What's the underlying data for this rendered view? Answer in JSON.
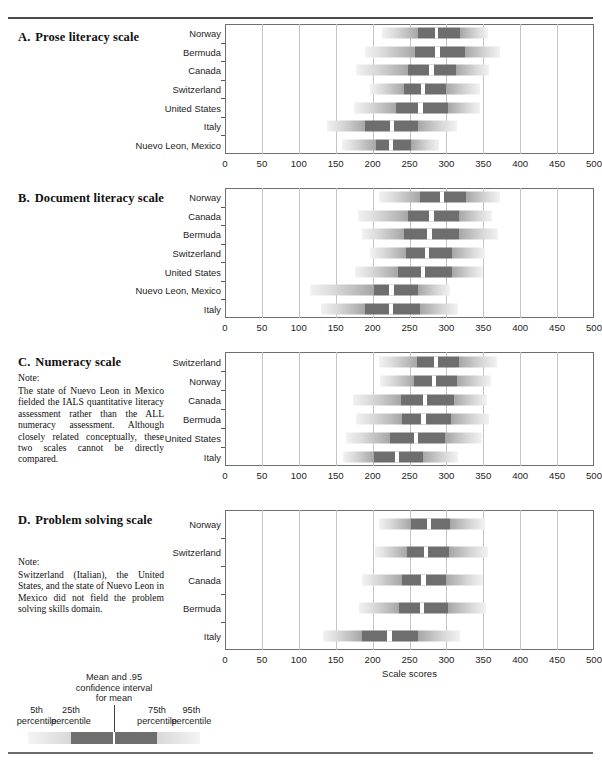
{
  "figure": {
    "axis_title": "Scale scores",
    "x_min": 0,
    "x_max": 500,
    "x_ticks": [
      0,
      50,
      100,
      150,
      200,
      250,
      300,
      350,
      400,
      450,
      500
    ],
    "legend": {
      "markers": [
        {
          "label_line1": "5th",
          "label_line2": "percentile",
          "value": 5
        },
        {
          "label_line1": "25th",
          "label_line2": "percentile",
          "value": 25
        },
        {
          "label_line1": "75th",
          "label_line2": "percentile",
          "value": 75
        },
        {
          "label_line1": "95th",
          "label_line2": "percentile",
          "value": 95
        }
      ],
      "mean_caption_line1": "Mean and .95",
      "mean_caption_line2": "confidence interval",
      "mean_caption_line3": "for mean"
    },
    "colors": {
      "box_fill": "#6e6e6e",
      "whisker_light": "#f2f2f2",
      "whisker_dark": "#a6a6a6",
      "mean_line": "#ffffff",
      "gridline": "#c4c4c4",
      "frame": "#6f6f6f"
    }
  },
  "chart_data": [
    {
      "type": "bar",
      "panel_letter": "A.",
      "title": "Prose literacy scale",
      "xlabel": "",
      "ylabel": "",
      "xlim": [
        0,
        500
      ],
      "grid": true,
      "categories": [
        "Norway",
        "Bermuda",
        "Canada",
        "Switzerland",
        "United States",
        "Italy",
        "Nuevo Leon, Mexico"
      ],
      "series": [
        {
          "name": "Norway",
          "p5": 213,
          "p25": 262,
          "mean_lo": 284,
          "mean_hi": 289,
          "p75": 318,
          "p95": 356
        },
        {
          "name": "Bermuda",
          "p25": 258,
          "p5": 190,
          "mean_lo": 284,
          "mean_hi": 291,
          "p75": 325,
          "p95": 372
        },
        {
          "name": "Canada",
          "p5": 177,
          "p25": 248,
          "mean_lo": 277,
          "mean_hi": 283,
          "p75": 313,
          "p95": 358
        },
        {
          "name": "Switzerland",
          "p5": 196,
          "p25": 242,
          "mean_lo": 266,
          "mean_hi": 271,
          "p75": 300,
          "p95": 345
        },
        {
          "name": "United States",
          "p5": 175,
          "p25": 232,
          "mean_lo": 262,
          "mean_hi": 268,
          "p75": 302,
          "p95": 345
        },
        {
          "name": "Italy",
          "p5": 138,
          "p25": 190,
          "mean_lo": 224,
          "mean_hi": 229,
          "p75": 262,
          "p95": 315
        },
        {
          "name": "Nuevo Leon, Mexico",
          "p5": 158,
          "p25": 205,
          "mean_lo": 222,
          "mean_hi": 228,
          "p75": 252,
          "p95": 290
        }
      ]
    },
    {
      "type": "bar",
      "panel_letter": "B.",
      "title": "Document literacy scale",
      "xlabel": "",
      "ylabel": "",
      "xlim": [
        0,
        500
      ],
      "grid": true,
      "categories": [
        "Norway",
        "Canada",
        "Bermuda",
        "Switzerland",
        "United States",
        "Nuevo Leon, Mexico",
        "Italy"
      ],
      "series": [
        {
          "name": "Norway",
          "p5": 208,
          "p25": 264,
          "mean_lo": 291,
          "mean_hi": 297,
          "p75": 327,
          "p95": 372
        },
        {
          "name": "Canada",
          "p5": 180,
          "p25": 248,
          "mean_lo": 276,
          "mean_hi": 283,
          "p75": 317,
          "p95": 362
        },
        {
          "name": "Bermuda",
          "p5": 186,
          "p25": 242,
          "mean_lo": 274,
          "mean_hi": 280,
          "p75": 317,
          "p95": 370
        },
        {
          "name": "Switzerland",
          "p5": 196,
          "p25": 245,
          "mean_lo": 271,
          "mean_hi": 276,
          "p75": 307,
          "p95": 353
        },
        {
          "name": "United States",
          "p5": 176,
          "p25": 234,
          "mean_lo": 265,
          "mean_hi": 271,
          "p75": 308,
          "p95": 350
        },
        {
          "name": "Nuevo Leon, Mexico",
          "p5": 115,
          "p25": 202,
          "mean_lo": 222,
          "mean_hi": 229,
          "p75": 261,
          "p95": 305
        },
        {
          "name": "Italy",
          "p5": 130,
          "p25": 190,
          "mean_lo": 222,
          "mean_hi": 228,
          "p75": 264,
          "p95": 316
        }
      ]
    },
    {
      "type": "bar",
      "panel_letter": "C.",
      "title": "Numeracy scale",
      "xlabel": "",
      "ylabel": "",
      "xlim": [
        0,
        500
      ],
      "grid": true,
      "note_head": "Note:",
      "note": "The state of Nuevo Leon in Mexico fielded the IALS quantitative literacy assessment rather than the ALL numeracy assessment. Although closely related conceptually, these two scales cannot be directly compared.",
      "categories": [
        "Switzerland",
        "Norway",
        "Canada",
        "Bermuda",
        "United States",
        "Italy"
      ],
      "series": [
        {
          "name": "Switzerland",
          "p5": 208,
          "p25": 260,
          "mean_lo": 283,
          "mean_hi": 289,
          "p75": 317,
          "p95": 368
        },
        {
          "name": "Norway",
          "p5": 210,
          "p25": 256,
          "mean_lo": 281,
          "mean_hi": 286,
          "p75": 314,
          "p95": 360
        },
        {
          "name": "Canada",
          "p5": 173,
          "p25": 238,
          "mean_lo": 268,
          "mean_hi": 274,
          "p75": 310,
          "p95": 355
        },
        {
          "name": "Bermuda",
          "p5": 178,
          "p25": 240,
          "mean_lo": 266,
          "mean_hi": 272,
          "p75": 306,
          "p95": 358
        },
        {
          "name": "United States",
          "p5": 164,
          "p25": 224,
          "mean_lo": 256,
          "mean_hi": 262,
          "p75": 298,
          "p95": 348
        },
        {
          "name": "Italy",
          "p5": 160,
          "p25": 202,
          "mean_lo": 231,
          "mean_hi": 236,
          "p75": 268,
          "p95": 316
        }
      ]
    },
    {
      "type": "bar",
      "panel_letter": "D.",
      "title": "Problem solving scale",
      "xlabel": "Scale scores",
      "ylabel": "",
      "xlim": [
        0,
        500
      ],
      "grid": true,
      "note_head": "Note:",
      "note": "Switzerland (Italian), the United States, and the state of Nuevo Leon in Mexico did not field the problem solving skills domain.",
      "categories": [
        "Norway",
        "Switzerland",
        "Canada",
        "Bermuda",
        "Italy"
      ],
      "series": [
        {
          "name": "Norway",
          "p5": 208,
          "p25": 252,
          "mean_lo": 274,
          "mean_hi": 279,
          "p75": 305,
          "p95": 352
        },
        {
          "name": "Switzerland",
          "p5": 203,
          "p25": 246,
          "mean_lo": 270,
          "mean_hi": 275,
          "p75": 304,
          "p95": 356
        },
        {
          "name": "Canada",
          "p5": 185,
          "p25": 240,
          "mean_lo": 266,
          "mean_hi": 272,
          "p75": 300,
          "p95": 350
        },
        {
          "name": "Bermuda",
          "p5": 182,
          "p25": 236,
          "mean_lo": 264,
          "mean_hi": 270,
          "p75": 302,
          "p95": 354
        },
        {
          "name": "Italy",
          "p5": 133,
          "p25": 186,
          "mean_lo": 220,
          "mean_hi": 226,
          "p75": 262,
          "p95": 318
        }
      ]
    }
  ]
}
